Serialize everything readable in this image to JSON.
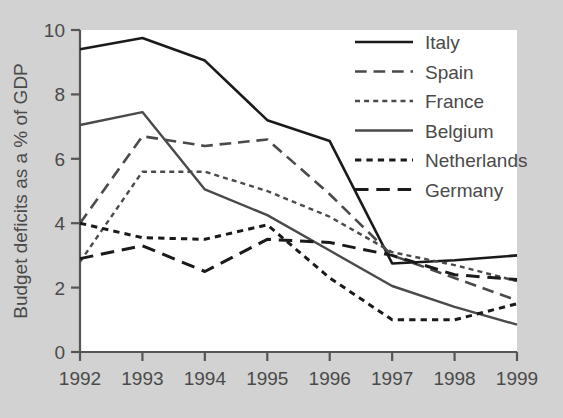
{
  "chart_data": {
    "type": "line",
    "title": "",
    "xlabel": "",
    "ylabel": "Budget deficits as a % of GDP",
    "x": [
      "1992",
      "1993",
      "1994",
      "1995",
      "1996",
      "1997",
      "1998",
      "1999"
    ],
    "xlim": [
      1992,
      1999
    ],
    "ylim": [
      0,
      10
    ],
    "yticks": [
      0,
      2,
      4,
      6,
      8,
      10
    ],
    "ytick_labels": [
      "0",
      "2",
      "4",
      "6",
      "8",
      "10"
    ],
    "grid": false,
    "legend_position": "top-right",
    "series": [
      {
        "name": "Italy",
        "style": "solid",
        "color": "#1a1a1a",
        "width": 2.6,
        "values": [
          9.4,
          9.75,
          9.05,
          7.2,
          6.55,
          2.75,
          2.85,
          3.0
        ]
      },
      {
        "name": "Spain",
        "style": "long-dash",
        "color": "#4a4a4a",
        "width": 2.6,
        "values": [
          4.0,
          6.7,
          6.4,
          6.6,
          4.9,
          3.0,
          2.3,
          1.6
        ]
      },
      {
        "name": "France",
        "style": "short-dash",
        "color": "#4a4a4a",
        "width": 2.4,
        "values": [
          2.8,
          5.6,
          5.6,
          5.0,
          4.2,
          3.1,
          2.7,
          2.2
        ]
      },
      {
        "name": "Belgium",
        "style": "solid",
        "color": "#4a4a4a",
        "width": 2.4,
        "values": [
          7.05,
          7.45,
          5.05,
          4.25,
          3.15,
          2.05,
          1.4,
          0.85
        ]
      },
      {
        "name": "Netherlands",
        "style": "short-dash",
        "color": "#1a1a1a",
        "width": 3.0,
        "values": [
          4.0,
          3.55,
          3.5,
          3.95,
          2.3,
          1.0,
          1.0,
          1.5
        ]
      },
      {
        "name": "Germany",
        "style": "long-dash",
        "color": "#1a1a1a",
        "width": 3.0,
        "values": [
          2.9,
          3.3,
          2.5,
          3.5,
          3.4,
          3.0,
          2.4,
          2.25
        ]
      }
    ]
  },
  "legend": {
    "entries": [
      "Italy",
      "Spain",
      "France",
      "Belgium",
      "Netherlands",
      "Germany"
    ]
  }
}
